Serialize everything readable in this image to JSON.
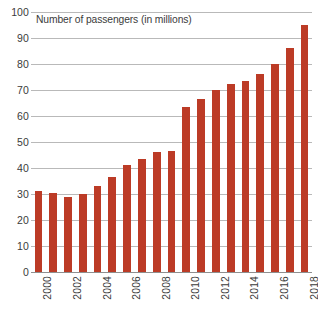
{
  "chart_data": {
    "type": "bar",
    "title": "Number of passengers (in millions)",
    "xlabel": "",
    "ylabel": "",
    "ylim": [
      0,
      100
    ],
    "ytick_step": 10,
    "yticks": [
      0,
      10,
      20,
      30,
      40,
      50,
      60,
      70,
      80,
      90,
      100
    ],
    "grid": true,
    "legend": false,
    "legend_position": "none",
    "bar_color": "#bc3b26",
    "gridline_color": "#b9b9b9",
    "text_color": "#3b3b3b",
    "categories": [
      "2000",
      "2001",
      "2002",
      "2003",
      "2004",
      "2005",
      "2006",
      "2007",
      "2008",
      "2009",
      "2010",
      "2011",
      "2012",
      "2013",
      "2014",
      "2015",
      "2016",
      "2017",
      "2018"
    ],
    "visible_xtick_labels": [
      "2000",
      "2002",
      "2004",
      "2006",
      "2008",
      "2010",
      "2012",
      "2014",
      "2016",
      "2018"
    ],
    "values": [
      31,
      30.5,
      29,
      30,
      33,
      36.7,
      41,
      43.5,
      46,
      46.5,
      63.5,
      66.5,
      70,
      72.5,
      73.5,
      76,
      80,
      86,
      95
    ]
  }
}
